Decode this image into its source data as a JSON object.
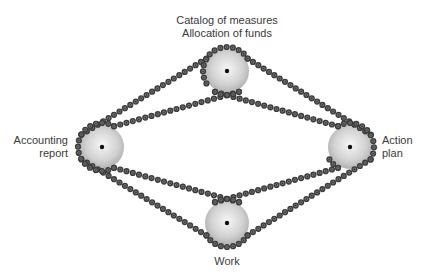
{
  "diagram": {
    "type": "chain-and-sprocket cycle",
    "nodes": [
      {
        "id": "top",
        "label_lines": [
          "Catalog of measures",
          "Allocation of funds"
        ],
        "center": [
          227,
          71
        ]
      },
      {
        "id": "left",
        "label_lines": [
          "Accounting",
          "report"
        ],
        "center": [
          102,
          147
        ]
      },
      {
        "id": "right",
        "label_lines": [
          "Action",
          "plan"
        ],
        "center": [
          350,
          147
        ]
      },
      {
        "id": "bottom",
        "label_lines": [
          "Work"
        ],
        "center": [
          227,
          223
        ]
      }
    ],
    "colors": {
      "chain": "#3c3c3c",
      "link_center": "#8a8a8a",
      "gear_light": "#f4f4f4",
      "gear_dark": "#b0b0b0",
      "hub": "#111111",
      "text": "#3a3a3a",
      "background": "#ffffff"
    }
  },
  "labels": {
    "top_line1": "Catalog of measures",
    "top_line2": "Allocation of funds",
    "left_line1": "Accounting",
    "left_line2": "report",
    "right_line1": "Action",
    "right_line2": "plan",
    "bottom": "Work"
  }
}
